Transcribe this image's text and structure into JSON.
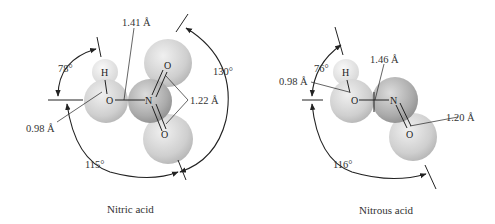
{
  "diagrams": [
    {
      "caption": "Nitric acid",
      "atoms": {
        "h": "H",
        "o_hydroxyl": "O",
        "n": "N",
        "o_top": "O",
        "o_bottom": "O"
      },
      "bond_lengths": {
        "o_h": "0.98 Å",
        "o_n": "1.41 Å",
        "n_o": "1.22 Å"
      },
      "angles": {
        "a1": "78°",
        "a2": "115°",
        "a3": "130°"
      }
    },
    {
      "caption": "Nitrous acid",
      "atoms": {
        "h": "H",
        "o_hydroxyl": "O",
        "n": "N",
        "o_terminal": "O"
      },
      "bond_lengths": {
        "o_h": "0.98 Å",
        "o_n": "1.46 Å",
        "n_o": "1.20 Å"
      },
      "angles": {
        "a1": "76°",
        "a2": "116°"
      }
    }
  ],
  "colors": {
    "sphere_light": "#f2f2f2",
    "sphere_mid": "#c8c8c8",
    "sphere_dark": "#9a9a9a",
    "line": "#222222"
  }
}
